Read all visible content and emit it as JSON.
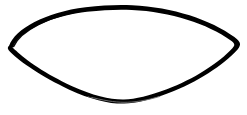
{
  "canvas": {
    "width": 247,
    "height": 115,
    "background_color": "#ffffff",
    "title": "lens-shaped closed outline drawing"
  },
  "figure": {
    "name": "lens-outline",
    "fill_color": "#ffffff",
    "stroke_color": "#000000",
    "thin_stroke_color": "#777777",
    "stroke_min_px": 1,
    "stroke_max_px": 6,
    "vertices": {
      "left_tip": [
        10,
        46
      ],
      "right_tip": [
        238,
        43
      ],
      "top_apex": [
        120,
        7
      ],
      "bottom_apex": [
        125,
        102
      ]
    },
    "segments": [
      {
        "name": "top-left-arc",
        "from": [
          10,
          46
        ],
        "to": [
          120,
          7
        ],
        "thickness_px": 6
      },
      {
        "name": "top-right-arc",
        "from": [
          120,
          7
        ],
        "to": [
          238,
          43
        ],
        "thickness_px": 4
      },
      {
        "name": "bottom-right-arc",
        "from": [
          238,
          43
        ],
        "to": [
          125,
          102
        ],
        "thickness_px": 3
      },
      {
        "name": "bottom-left-arc",
        "from": [
          125,
          102
        ],
        "to": [
          10,
          46
        ],
        "thickness_px": 5
      }
    ]
  }
}
